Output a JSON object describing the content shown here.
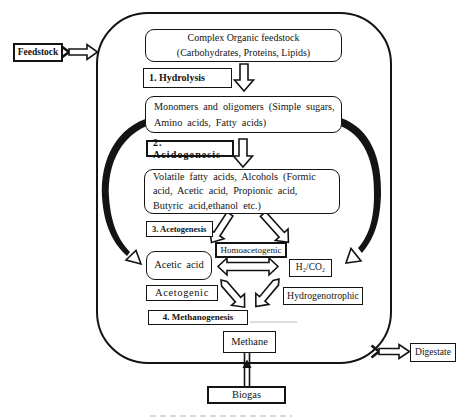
{
  "colors": {
    "ink": "#141414",
    "paper": "#ffffff"
  },
  "external": {
    "feedstock_label": "Feedstock",
    "digestate_label": "Digestate",
    "biogas_label": "Biogas"
  },
  "process": {
    "complex_feedstock": {
      "line1": "Complex Organic feedstock",
      "line2": "(Carbohydrates, Proteins, Lipids)"
    },
    "stage1": "1. Hydrolysis",
    "monomers": {
      "line1": "Monomers and oligomers (Simple sugars,",
      "line2": "Amino acids, Fatty acids)"
    },
    "stage2": "2. Acidogenesis",
    "vfa": {
      "line1": "Volatile fatty acids, Alcohols (Formic",
      "line2": "acid, Acetic acid, Propionic acid,",
      "line3": "Butyric acid,ethanol etc.)"
    },
    "stage3": "3. Acetogenesis",
    "homoacetogenic_label": "Homoacetogenic",
    "acetic_acid": "Acetic acid",
    "h2_co2": "H₂/CO₂",
    "acetogenic_label": "Acetogenic",
    "hydrogenotrophic_label": "Hydrogenotrophic",
    "stage4": "4. Methanogenesis",
    "methane": "Methane"
  }
}
